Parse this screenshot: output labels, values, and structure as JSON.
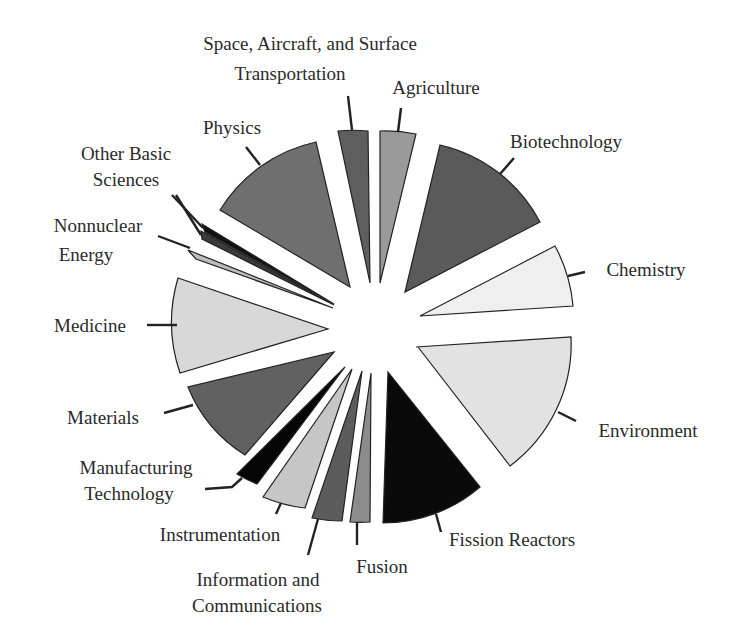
{
  "chart_data": {
    "type": "pie",
    "subtype": "exploded polar-area (varying radius) pie",
    "title": "",
    "legend": "none (direct labels with leader lines)",
    "categories": [
      "Space, Aircraft, and Surface Transportation",
      "Agriculture",
      "Biotechnology",
      "Chemistry",
      "Environment",
      "Fission Reactors",
      "Fusion",
      "Information and Communications",
      "Instrumentation",
      "Manufacturing Technology",
      "Materials",
      "Medicine",
      "Nonnuclear Energy",
      "Other Basic Sciences",
      "Physics"
    ],
    "wedges": [
      {
        "label": "Space, Aircraft, and Surface Transportation",
        "fill": "#5e5e5e",
        "tip": [
          370,
          283
        ],
        "a": [
          338,
          131
        ],
        "b": [
          368,
          131
        ],
        "sweep": 1,
        "leader": [
          [
            352,
            130
          ],
          [
            348,
            96
          ]
        ],
        "text": [
          {
            "t": "Space, Aircraft, and Surface",
            "x": 310,
            "y": 50
          },
          {
            "t": "Transportation",
            "x": 290,
            "y": 80
          }
        ]
      },
      {
        "label": "Agriculture",
        "fill": "#9a9a9a",
        "tip": [
          380,
          283
        ],
        "a": [
          380,
          131
        ],
        "b": [
          416,
          134
        ],
        "sweep": 1,
        "leader": [
          [
            398,
            132
          ],
          [
            401,
            108
          ]
        ],
        "text": [
          {
            "t": "Agriculture",
            "x": 436,
            "y": 94
          }
        ]
      },
      {
        "label": "Biotechnology",
        "fill": "#5a5a5a",
        "tip": [
          405,
          292
        ],
        "a": [
          440,
          145
        ],
        "b": [
          540,
          222
        ],
        "sweep": 1,
        "leader": [
          [
            500,
            174
          ],
          [
            514,
            158
          ]
        ],
        "text": [
          {
            "t": "Biotechnology",
            "x": 566,
            "y": 148
          }
        ]
      },
      {
        "label": "Chemistry",
        "fill": "#efefef",
        "tip": [
          420,
          316
        ],
        "a": [
          555,
          246
        ],
        "b": [
          573,
          306
        ],
        "sweep": 1,
        "leader": [
          [
            568,
            276
          ],
          [
            585,
            272
          ]
        ],
        "text": [
          {
            "t": "Chemistry",
            "x": 646,
            "y": 276
          }
        ]
      },
      {
        "label": "Environment",
        "fill": "#e2e2e2",
        "tip": [
          418,
          347
        ],
        "a": [
          571,
          337
        ],
        "b": [
          510,
          466
        ],
        "sweep": 1,
        "start": [
          416,
          347
        ],
        "leader": [
          [
            558,
            412
          ],
          [
            576,
            421
          ]
        ],
        "text": [
          {
            "t": "Environment",
            "x": 648,
            "y": 437
          }
        ]
      },
      {
        "label": "Fission Reactors",
        "fill": "#0a0a0a",
        "tip": [
          388,
          372
        ],
        "a": [
          480,
          487
        ],
        "b": [
          383,
          523
        ],
        "sweep": 1,
        "leader": [
          [
            436,
            514
          ],
          [
            441,
            532
          ]
        ],
        "text": [
          {
            "t": "Fission Reactors",
            "x": 512,
            "y": 546
          }
        ]
      },
      {
        "label": "Fusion",
        "fill": "#8c8c8c",
        "tip": [
          371,
          373
        ],
        "a": [
          370,
          522
        ],
        "b": [
          350,
          522
        ],
        "sweep": 1,
        "leader": [
          [
            357,
            522
          ],
          [
            357,
            545
          ]
        ],
        "text": [
          {
            "t": "Fusion",
            "x": 382,
            "y": 573
          }
        ]
      },
      {
        "label": "Information and Communications",
        "fill": "#5c5c5c",
        "tip": [
          362,
          371
        ],
        "a": [
          342,
          521
        ],
        "b": [
          312,
          518
        ],
        "sweep": 1,
        "leader": [
          [
            318,
            519
          ],
          [
            308,
            555
          ]
        ],
        "text": [
          {
            "t": "Information and",
            "x": 258,
            "y": 586
          },
          {
            "t": "Communications",
            "x": 257,
            "y": 612
          }
        ]
      },
      {
        "label": "Instrumentation",
        "fill": "#c6c6c6",
        "tip": [
          352,
          369
        ],
        "a": [
          305,
          508
        ],
        "b": [
          263,
          497
        ],
        "sweep": 1,
        "leader": [
          [
            281,
            503
          ],
          [
            276,
            514
          ]
        ],
        "text": [
          {
            "t": "Instrumentation",
            "x": 220,
            "y": 541
          }
        ]
      },
      {
        "label": "Manufacturing Technology",
        "fill": "#050505",
        "tip": [
          345,
          367
        ],
        "a": [
          257,
          484
        ],
        "b": [
          237,
          474
        ],
        "sweep": 1,
        "leader": [
          [
            242,
            478
          ],
          [
            232,
            487
          ],
          [
            205,
            489
          ]
        ],
        "text": [
          {
            "t": "Manufacturing",
            "x": 136,
            "y": 474
          },
          {
            "t": "Technology",
            "x": 129,
            "y": 500
          }
        ]
      },
      {
        "label": "Materials",
        "fill": "#616161",
        "tip": [
          334,
          352
        ],
        "a": [
          245,
          455
        ],
        "b": [
          188,
          387
        ],
        "sweep": 1,
        "leader": [
          [
            193,
            405
          ],
          [
            164,
            413
          ]
        ],
        "text": [
          {
            "t": "Materials",
            "x": 103,
            "y": 424
          }
        ]
      },
      {
        "label": "Medicine",
        "fill": "#d8d8d8",
        "tip": [
          328,
          329
        ],
        "a": [
          180,
          373
        ],
        "b": [
          178,
          278
        ],
        "sweep": 1,
        "leader": [
          [
            177,
            325
          ],
          [
            147,
            325
          ]
        ],
        "text": [
          {
            "t": "Medicine",
            "x": 90,
            "y": 332
          }
        ]
      },
      {
        "label": "Nonnuclear Energy",
        "fill": "#bcbcbc",
        "tip": [
          333,
          308
        ],
        "a": [
          196,
          259
        ],
        "b": [
          188,
          250
        ],
        "sweep": 1,
        "leader": [
          [
            190,
            248
          ],
          [
            158,
            236
          ]
        ],
        "text": [
          {
            "t": "Nonnuclear",
            "x": 98,
            "y": 232
          },
          {
            "t": "Energy",
            "x": 86,
            "y": 261
          }
        ]
      },
      {
        "label": "Other Basic Sciences",
        "fill": "#111111",
        "tip": [
          334,
          304
        ],
        "a": [
          205,
          232
        ],
        "b": [
          202,
          224
        ],
        "sweep": 1,
        "leader": [
          [
            203,
            228
          ],
          [
            172,
            195
          ]
        ],
        "text": [
          {
            "t": "Other Basic",
            "x": 126,
            "y": 160
          },
          {
            "t": "Sciences",
            "x": 126,
            "y": 186
          }
        ]
      },
      {
        "label": "Other Basic Sciences (2)",
        "fill": "#3a3a3a",
        "tip": [
          334,
          305
        ],
        "a": [
          202,
          239
        ],
        "b": [
          201,
          231
        ],
        "sweep": 1,
        "leader": [
          [
            201,
            235
          ],
          [
            176,
            195
          ]
        ],
        "text": []
      },
      {
        "label": "Physics",
        "fill": "#6f6f6f",
        "tip": [
          350,
          287
        ],
        "a": [
          220,
          210
        ],
        "b": [
          316,
          142
        ],
        "sweep": 1,
        "leader": [
          [
            260,
            165
          ],
          [
            246,
            147
          ]
        ],
        "text": [
          {
            "t": "Physics",
            "x": 232,
            "y": 134
          }
        ]
      }
    ],
    "values_note": "No numeric labels shown; wedge area approximates relative share.",
    "approx_relative_area": {
      "Space, Aircraft, and Surface Transportation": 3,
      "Agriculture": 3,
      "Biotechnology": 12,
      "Chemistry": 6,
      "Environment": 15,
      "Fission Reactors": 10,
      "Fusion": 2,
      "Information and Communications": 4,
      "Instrumentation": 5,
      "Manufacturing Technology": 2,
      "Materials": 8,
      "Medicine": 10,
      "Nonnuclear Energy": 2,
      "Other Basic Sciences": 1,
      "Physics": 13
    }
  }
}
